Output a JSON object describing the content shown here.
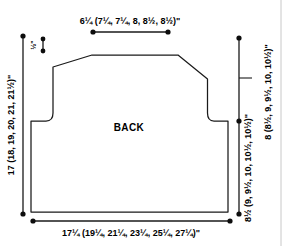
{
  "figure": {
    "type": "garment-schematic",
    "piece_label": "BACK",
    "units": "inches",
    "size_count": 6
  },
  "dimensions": {
    "shoulder_to_shoulder": {
      "name": "upper-back-width",
      "base": "6",
      "base_frac": "1/4",
      "text": "6¼ (7¼, 7¼, 8, 8½, 8½)\"",
      "values": [
        "6¼",
        "7¼",
        "7¼",
        "8",
        "8½",
        "8½"
      ],
      "position": "top"
    },
    "lower_body_width": {
      "name": "lower-back-width",
      "text": "17¼ (19¼, 21¼, 23¼, 25¼, 27¼)\"",
      "values": [
        "17¼",
        "19¼",
        "21¼",
        "23¼",
        "25¼",
        "27¼"
      ],
      "position": "bottom"
    },
    "total_length": {
      "name": "total-length",
      "text": "17 (18, 19, 20, 21, 21½)\"",
      "values": [
        "17",
        "18",
        "19",
        "20",
        "21",
        "21½"
      ],
      "position": "left"
    },
    "length_to_armhole": {
      "name": "length-to-underarm",
      "text": "8½ (9, 9½, 10, 10½, 10½)\"",
      "values": [
        "8½",
        "9",
        "9½",
        "10",
        "10½",
        "10½"
      ],
      "position": "right-inner"
    },
    "armhole_depth": {
      "name": "armhole-depth",
      "text": "8 (8½, 9, 9½, 10, 10½)\"",
      "values": [
        "8",
        "8½",
        "9",
        "9½",
        "10",
        "10½"
      ],
      "position": "right-outer"
    },
    "shoulder_slope": {
      "name": "shoulder-slope-depth",
      "text": "½\"",
      "values": [
        "½"
      ],
      "position": "upper-left"
    }
  },
  "colors": {
    "outline": "#1a1a1a",
    "dimension_line": "#1a1a1a",
    "text": "#000000",
    "background": "#ffffff",
    "page_edge": "#c8c8c8"
  }
}
